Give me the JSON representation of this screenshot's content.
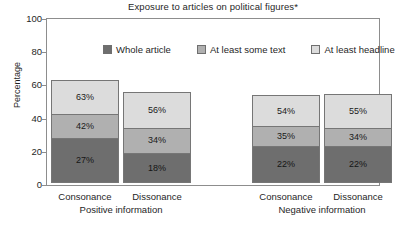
{
  "chart_data": {
    "type": "bar",
    "subtype": "stacked-bar-grouped",
    "title": "Exposure to articles on political figures*",
    "xlabel": "",
    "ylabel": "Percentage",
    "ylim": [
      0,
      100
    ],
    "yticks": [
      0,
      20,
      40,
      60,
      80,
      100
    ],
    "ytick_labels": [
      "0",
      "20",
      "40",
      "60",
      "80",
      "100"
    ],
    "grid": false,
    "legend_position": "top-inside",
    "legend": [
      {
        "name": "Whole article",
        "color": "#6e6e6e"
      },
      {
        "name": "At least some text",
        "color": "#b0b0b0"
      },
      {
        "name": "At least headline",
        "color": "#dcdcdc"
      }
    ],
    "categories": [
      "Consonance",
      "Dissonance",
      "Consonance",
      "Dissonance"
    ],
    "groups": [
      {
        "name": "Positive information",
        "categories": [
          "Consonance",
          "Dissonance"
        ]
      },
      {
        "name": "Negative information",
        "categories": [
          "Consonance",
          "Dissonance"
        ]
      }
    ],
    "series": [
      {
        "name": "Whole article",
        "values": [
          27,
          18,
          22,
          22
        ]
      },
      {
        "name": "At least some text",
        "values": [
          42,
          34,
          35,
          34
        ]
      },
      {
        "name": "At least headline",
        "values": [
          63,
          56,
          54,
          55
        ]
      }
    ],
    "note": "Segment labels are cumulative percentage tops; plotted band heights are the differences.",
    "bars": [
      {
        "group": "Positive information",
        "category": "Consonance",
        "segments": [
          {
            "series": "At least headline",
            "label": "63%",
            "value": 63,
            "band_from": 42,
            "band_to": 63
          },
          {
            "series": "At least some text",
            "label": "42%",
            "value": 42,
            "band_from": 27,
            "band_to": 42
          },
          {
            "series": "Whole article",
            "label": "27%",
            "value": 27,
            "band_from": 0,
            "band_to": 27
          }
        ]
      },
      {
        "group": "Positive information",
        "category": "Dissonance",
        "segments": [
          {
            "series": "At least headline",
            "label": "56%",
            "value": 56,
            "band_from": 34,
            "band_to": 56
          },
          {
            "series": "At least some text",
            "label": "34%",
            "value": 34,
            "band_from": 18,
            "band_to": 34
          },
          {
            "series": "Whole article",
            "label": "18%",
            "value": 18,
            "band_from": 0,
            "band_to": 18
          }
        ]
      },
      {
        "group": "Negative information",
        "category": "Consonance",
        "segments": [
          {
            "series": "At least headline",
            "label": "54%",
            "value": 54,
            "band_from": 35,
            "band_to": 54
          },
          {
            "series": "At least some text",
            "label": "35%",
            "value": 35,
            "band_from": 22,
            "band_to": 35
          },
          {
            "series": "Whole article",
            "label": "22%",
            "value": 22,
            "band_from": 0,
            "band_to": 22
          }
        ]
      },
      {
        "group": "Negative information",
        "category": "Dissonance",
        "segments": [
          {
            "series": "At least headline",
            "label": "55%",
            "value": 55,
            "band_from": 34,
            "band_to": 55
          },
          {
            "series": "At least some text",
            "label": "34%",
            "value": 34,
            "band_from": 22,
            "band_to": 34
          },
          {
            "series": "Whole article",
            "label": "22%",
            "value": 22,
            "band_from": 0,
            "band_to": 22
          }
        ]
      }
    ]
  },
  "colors": {
    "whole_article": "#6e6e6e",
    "some_text": "#b0b0b0",
    "headline": "#dcdcdc",
    "frame": "#8d8d8d",
    "segment_border": "#767676",
    "text": "#1f1f1f",
    "background": "#ffffff"
  },
  "title": {
    "text": "Exposure to articles on political figures*"
  },
  "yaxis": {
    "title": "Percentage",
    "ticks": [
      {
        "label": "100",
        "value": 100
      },
      {
        "label": "80",
        "value": 80
      },
      {
        "label": "60",
        "value": 60
      },
      {
        "label": "40",
        "value": 40
      },
      {
        "label": "20",
        "value": 20
      },
      {
        "label": "0",
        "value": 0
      }
    ]
  },
  "legend": {
    "items": [
      {
        "label": "Whole article",
        "color": "#6e6e6e"
      },
      {
        "label": "At least some text",
        "color": "#b0b0b0"
      },
      {
        "label": "At least headline",
        "color": "#dcdcdc"
      }
    ]
  },
  "xaxis": {
    "categories": [
      {
        "label": "Consonance"
      },
      {
        "label": "Dissonance"
      },
      {
        "label": "Consonance"
      },
      {
        "label": "Dissonance"
      }
    ],
    "groups": [
      {
        "label": "Positive information"
      },
      {
        "label": "Negative information"
      }
    ]
  }
}
